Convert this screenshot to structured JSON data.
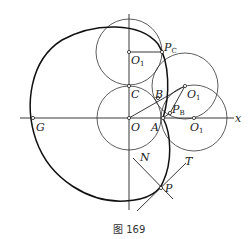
{
  "figure": {
    "caption": "图 169",
    "axis_label_x": "x",
    "points": {
      "O": {
        "label": "O"
      },
      "G": {
        "label": "G"
      },
      "A": {
        "label": "A"
      },
      "C": {
        "label": "C"
      },
      "B": {
        "label": "B"
      },
      "O1_top": {
        "label": "O",
        "sub": "1"
      },
      "O1_mid": {
        "label": "O",
        "sub": "1"
      },
      "O1_axis": {
        "label": "O",
        "sub": "1"
      },
      "PC": {
        "label": "P",
        "sub": "C"
      },
      "PB": {
        "label": "P",
        "sub": "B"
      },
      "P": {
        "label": "P"
      },
      "N": {
        "label": "N"
      },
      "T": {
        "label": "T"
      }
    },
    "colors": {
      "stroke": "#222222",
      "background": "#ffffff"
    }
  }
}
